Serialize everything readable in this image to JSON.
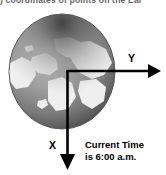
{
  "figure": {
    "caption_clipped": ") coordinates of points on the Ear",
    "globe": {
      "icon": "globe-earth-north-polar",
      "ocean_color": "#8d8d8d",
      "land_color": "#efefef",
      "shadow_color": "#3a3a3a",
      "highlight_color": "#d8d8d8"
    },
    "axes": {
      "color": "#000000",
      "origin_label": "",
      "y_axis": {
        "label": "Y",
        "direction": "right",
        "arrow_icon": "arrow-right-icon"
      },
      "x_axis": {
        "label": "X",
        "direction": "down",
        "arrow_icon": "arrow-down-icon"
      }
    },
    "annotation": {
      "line1": "Current Time",
      "line2": "is 6:00 a.m."
    }
  }
}
